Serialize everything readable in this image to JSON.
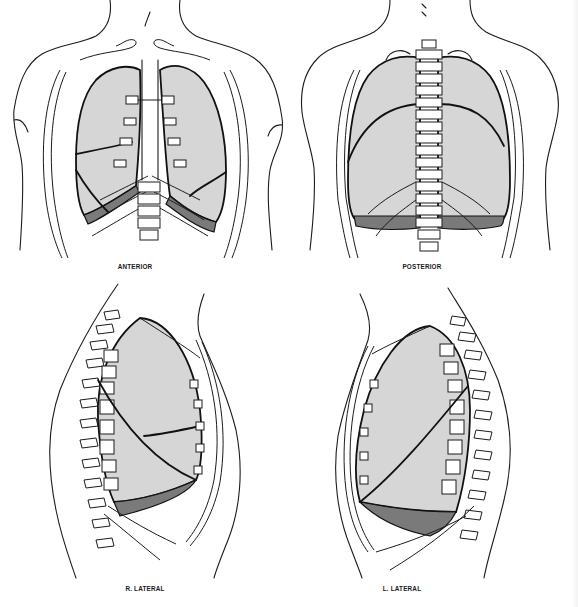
{
  "figure": {
    "panels": [
      {
        "id": "anterior",
        "label": "ANTERIOR"
      },
      {
        "id": "posterior",
        "label": "POSTERIOR"
      },
      {
        "id": "r-lateral",
        "label": "R. LATERAL"
      },
      {
        "id": "l-lateral",
        "label": "L. LATERAL"
      }
    ],
    "legend": {
      "lung_fill_color": "#d6d6d6",
      "pleural_recess_color": "#7a7a7a",
      "outline_color": "#111111"
    }
  }
}
